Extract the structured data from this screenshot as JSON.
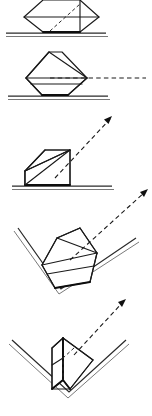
{
  "document": {
    "title": "Prism orientation sequence",
    "background_color": "#ffffff",
    "width": 152,
    "height": 416,
    "style": "technical line drawing, black ink on white, no text labels"
  },
  "palette": {
    "ink": "#1a1a1a",
    "ink_heavy": "#0d0d0d",
    "ground": "#2a2a2a",
    "ground_light": "#6a6a6a",
    "paper": "#ffffff"
  },
  "panels": [
    {
      "id": "panel-1",
      "name": "prism-on-flat-surface-top-cropped",
      "order": 1,
      "support": "flat-horizontal-surface",
      "object": "hexagonal-prism-diamond-profile",
      "object_orientation": "apex-up-cropped-at-frame-top",
      "has_guide_arrow": false,
      "has_hidden_dashed_edge": true,
      "ground_y": 33,
      "notes": "Object is clipped by the top edge of the image; only lower diamond half and baseline visible."
    },
    {
      "id": "panel-2",
      "name": "prism-on-flat-surface-with-horizontal-guide",
      "order": 2,
      "support": "flat-horizontal-surface",
      "object": "hexagonal-prism-diamond-profile",
      "object_orientation": "apex-up-resting-on-flat-base",
      "has_guide_arrow": true,
      "guide_arrow_direction": "horizontal-right",
      "has_hidden_dashed_edge": true,
      "ground_y": 96,
      "notes": "Dashed construction line runs horizontally right from the prism mid-edge."
    },
    {
      "id": "panel-3",
      "name": "wedge-on-flat-surface-with-diagonal-arrow",
      "order": 3,
      "support": "flat-horizontal-surface",
      "object": "right-triangular-wedge-prism",
      "object_orientation": "vertical-face-right-hypotenuse-rising-left-to-right",
      "has_guide_arrow": true,
      "guide_arrow_direction": "diagonal-up-right",
      "has_hidden_dashed_edge": true,
      "ground_y": 186,
      "notes": "Wedge sits flat; dashed arrow leaves along the hypotenuse direction up to the right."
    },
    {
      "id": "panel-4",
      "name": "prism-tilted-in-v-groove",
      "order": 4,
      "support": "v-groove-vee-block",
      "object": "hexagonal-prism-diamond-profile",
      "object_orientation": "tilted-seated-in-vee",
      "has_guide_arrow": true,
      "guide_arrow_direction": "diagonal-up-right",
      "has_hidden_dashed_edge": true,
      "vertex_x": 61,
      "vertex_y": 289,
      "notes": "Prism rests tilted against the right flank of the V-groove."
    },
    {
      "id": "panel-5",
      "name": "prism-upright-in-v-groove",
      "order": 5,
      "support": "v-groove-vee-block",
      "object": "hexagonal-prism-diamond-profile",
      "object_orientation": "upright-self-centered-in-vee",
      "has_guide_arrow": true,
      "guide_arrow_direction": "diagonal-up-right",
      "has_hidden_dashed_edge": true,
      "vertex_x": 69,
      "vertex_y": 392,
      "notes": "Prism settles symmetric and upright in the V-groove; final stable pose."
    }
  ],
  "arrows": [
    {
      "id": "arrow-1",
      "panel": "panel-2",
      "type": "dashed-guide",
      "from_x": 62,
      "from_y": 78,
      "to_x": 146,
      "to_y": 78,
      "arrowhead": false
    },
    {
      "id": "arrow-2",
      "panel": "panel-3",
      "type": "dashed-arrow",
      "from_x": 55,
      "from_y": 178,
      "to_x": 112,
      "to_y": 117,
      "arrowhead": true
    },
    {
      "id": "arrow-3",
      "panel": "panel-4",
      "type": "dashed-arrow",
      "from_x": 72,
      "from_y": 258,
      "to_x": 147,
      "to_y": 190,
      "arrowhead": true
    },
    {
      "id": "arrow-4",
      "panel": "panel-5",
      "type": "dashed-arrow",
      "from_x": 76,
      "from_y": 352,
      "to_x": 125,
      "to_y": 300,
      "arrowhead": true
    }
  ]
}
